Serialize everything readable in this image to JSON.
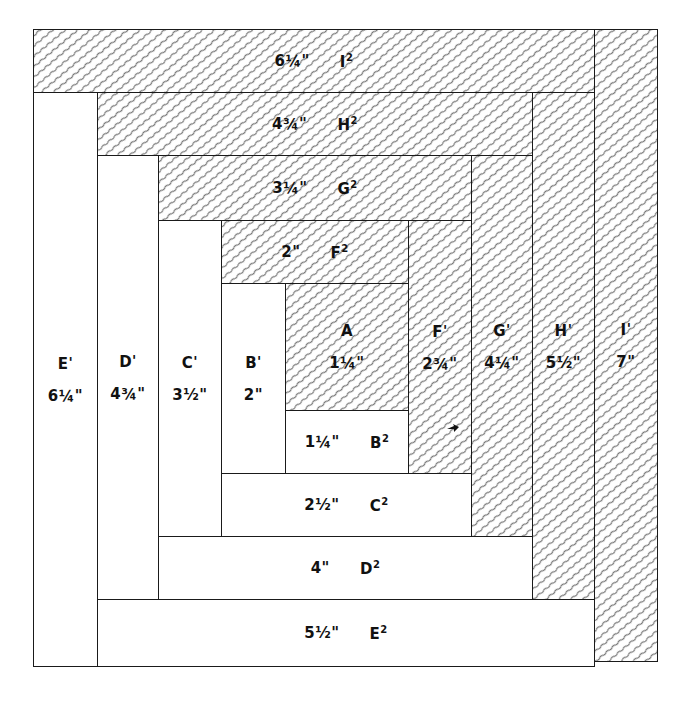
{
  "diagram": {
    "hatch_color": "#777777",
    "line_color": "#1a1a1a",
    "pieces": [
      {
        "id": "A",
        "name": "A",
        "sup": "",
        "size": "1¼\"",
        "shade": "dark",
        "x": 285,
        "y": 283,
        "w": 124,
        "h": 128,
        "orient": "v"
      },
      {
        "id": "B2",
        "name": "B",
        "sup": "2",
        "size": "1¼\"",
        "shade": "light",
        "x": 285,
        "y": 410,
        "w": 124,
        "h": 64,
        "orient": "h"
      },
      {
        "id": "B1",
        "name": "B",
        "sup": "1",
        "size": "2\"",
        "shade": "light",
        "x": 221,
        "y": 283,
        "w": 65,
        "h": 191,
        "orient": "v"
      },
      {
        "id": "F2",
        "name": "F",
        "sup": "2",
        "size": "2\"",
        "shade": "dark",
        "x": 221,
        "y": 220,
        "w": 188,
        "h": 64,
        "orient": "h"
      },
      {
        "id": "F1",
        "name": "F",
        "sup": "1",
        "size": "2¾\"",
        "shade": "dark",
        "x": 408,
        "y": 220,
        "w": 64,
        "h": 254,
        "orient": "v"
      },
      {
        "id": "C2",
        "name": "C",
        "sup": "2",
        "size": "2½\"",
        "shade": "light",
        "x": 221,
        "y": 473,
        "w": 251,
        "h": 64,
        "orient": "h"
      },
      {
        "id": "C1",
        "name": "C",
        "sup": "1",
        "size": "3½\"",
        "shade": "light",
        "x": 158,
        "y": 220,
        "w": 64,
        "h": 317,
        "orient": "v"
      },
      {
        "id": "G2",
        "name": "G",
        "sup": "2",
        "size": "3¼\"",
        "shade": "dark",
        "x": 158,
        "y": 155,
        "w": 314,
        "h": 66,
        "orient": "h"
      },
      {
        "id": "G1",
        "name": "G",
        "sup": "1",
        "size": "4¼\"",
        "shade": "dark",
        "x": 471,
        "y": 155,
        "w": 62,
        "h": 382,
        "orient": "v"
      },
      {
        "id": "D2",
        "name": "D",
        "sup": "2",
        "size": "4\"",
        "shade": "light",
        "x": 158,
        "y": 536,
        "w": 375,
        "h": 64,
        "orient": "h"
      },
      {
        "id": "D1",
        "name": "D",
        "sup": "1",
        "size": "4¾\"",
        "shade": "light",
        "x": 97,
        "y": 155,
        "w": 62,
        "h": 445,
        "orient": "v"
      },
      {
        "id": "H2",
        "name": "H",
        "sup": "2",
        "size": "4¾\"",
        "shade": "dark",
        "x": 97,
        "y": 92,
        "w": 436,
        "h": 64,
        "orient": "h"
      },
      {
        "id": "H1",
        "name": "H",
        "sup": "1",
        "size": "5½\"",
        "shade": "dark",
        "x": 532,
        "y": 92,
        "w": 63,
        "h": 508,
        "orient": "v"
      },
      {
        "id": "E2",
        "name": "E",
        "sup": "2",
        "size": "5½\"",
        "shade": "light",
        "x": 97,
        "y": 599,
        "w": 498,
        "h": 68,
        "orient": "h"
      },
      {
        "id": "E1",
        "name": "E",
        "sup": "1",
        "size": "6¼\"",
        "shade": "light",
        "x": 33,
        "y": 92,
        "w": 65,
        "h": 575,
        "orient": "v"
      },
      {
        "id": "I2",
        "name": "I",
        "sup": "2",
        "size": "6¼\"",
        "shade": "dark",
        "x": 33,
        "y": 29,
        "w": 562,
        "h": 64,
        "orient": "h"
      },
      {
        "id": "I1",
        "name": "I",
        "sup": "1",
        "size": "7\"",
        "shade": "dark",
        "x": 594,
        "y": 29,
        "w": 64,
        "h": 633,
        "orient": "v"
      }
    ]
  }
}
